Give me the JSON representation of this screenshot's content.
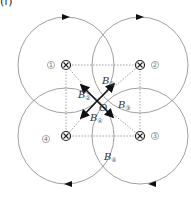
{
  "figure": {
    "panel_label": "(f)",
    "center_label": "O",
    "wires": [
      {
        "id": "1",
        "label": "①",
        "x": 66,
        "y": 65,
        "direction": "into-page"
      },
      {
        "id": "2",
        "label": "②",
        "x": 140,
        "y": 65,
        "direction": "into-page"
      },
      {
        "id": "3",
        "label": "③",
        "x": 140,
        "y": 136,
        "direction": "into-page"
      },
      {
        "id": "4",
        "label": "④",
        "x": 66,
        "y": 136,
        "direction": "into-page"
      }
    ],
    "field_labels": {
      "b1": {
        "base": "B",
        "sub": "①"
      },
      "b2": {
        "base": "B",
        "sub": "②"
      },
      "b3": {
        "base": "B",
        "sub": "③"
      },
      "b4": {
        "base": "B",
        "sub": "④"
      },
      "resultant": {
        "base": "B",
        "sub": "④"
      }
    },
    "colors": {
      "line": "#777777",
      "arrow": "#111111",
      "dotted": "#888888"
    }
  }
}
